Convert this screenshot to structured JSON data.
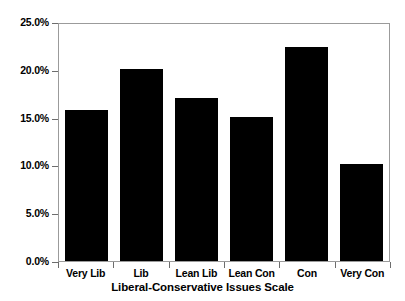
{
  "chart_data": {
    "type": "bar",
    "title": "",
    "xlabel": "Liberal-Conservative Issues Scale",
    "ylabel": "",
    "categories": [
      "Very Lib",
      "Lib",
      "Lean Lib",
      "Lean Con",
      "Con",
      "Very Con"
    ],
    "values": [
      15.8,
      20.1,
      17.0,
      15.1,
      22.4,
      10.1
    ],
    "ylim": [
      0,
      25
    ],
    "ytick_values": [
      0,
      5,
      10,
      15,
      20,
      25
    ],
    "ytick_labels": [
      "0.0%",
      "5.0%",
      "10.0%",
      "15.0%",
      "20.0%",
      "25.0%"
    ],
    "grid": false,
    "legend": false,
    "bar_color": "#000000",
    "frame_color": "#9b9b9b",
    "text_color": "#000000",
    "background": "#ffffff",
    "unit": "%"
  },
  "axes": {
    "x_title": "Liberal-Conservative Issues Scale"
  }
}
